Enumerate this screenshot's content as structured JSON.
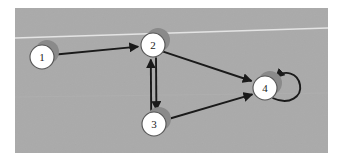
{
  "figure": {
    "kind": "directed-graph-diagram",
    "background_color": "#ffffff",
    "plate_color": "#aaaaaa",
    "plate": {
      "x": 15,
      "y": 8,
      "width": 313,
      "height": 145
    },
    "node_fill": "#ffffff",
    "node_stroke": "#555555",
    "node_shadow_color": "#8a8a8a",
    "edge_color": "#1a1a1a",
    "label_color": "#222222",
    "scan_line_color": "#e2e2e2"
  },
  "graph": {
    "nodes": [
      {
        "id": "1",
        "label": "1",
        "cx": 42,
        "cy": 57,
        "r": 12
      },
      {
        "id": "2",
        "label": "2",
        "cx": 153,
        "cy": 45,
        "r": 12
      },
      {
        "id": "3",
        "label": "3",
        "cx": 154,
        "cy": 124,
        "r": 12
      },
      {
        "id": "4",
        "label": "4",
        "cx": 265,
        "cy": 88,
        "r": 12
      }
    ],
    "edges": [
      {
        "id": "e1",
        "from": "1",
        "to": "2",
        "kind": "straight",
        "directed": true
      },
      {
        "id": "e2",
        "from": "2",
        "to": "4",
        "kind": "straight",
        "directed": true
      },
      {
        "id": "e3",
        "from": "3",
        "to": "4",
        "kind": "straight",
        "directed": true
      },
      {
        "id": "e4",
        "from": "2",
        "to": "3",
        "kind": "parallel-down",
        "directed": true
      },
      {
        "id": "e5",
        "from": "3",
        "to": "2",
        "kind": "parallel-up",
        "directed": true
      },
      {
        "id": "e6",
        "from": "4",
        "to": "4",
        "kind": "self-loop",
        "directed": true
      }
    ]
  },
  "chart_data": {
    "type": "diagram",
    "title": "",
    "nodes": [
      "1",
      "2",
      "3",
      "4"
    ],
    "directed_edges": [
      [
        "1",
        "2"
      ],
      [
        "2",
        "3"
      ],
      [
        "3",
        "2"
      ],
      [
        "2",
        "4"
      ],
      [
        "3",
        "4"
      ],
      [
        "4",
        "4"
      ]
    ]
  }
}
